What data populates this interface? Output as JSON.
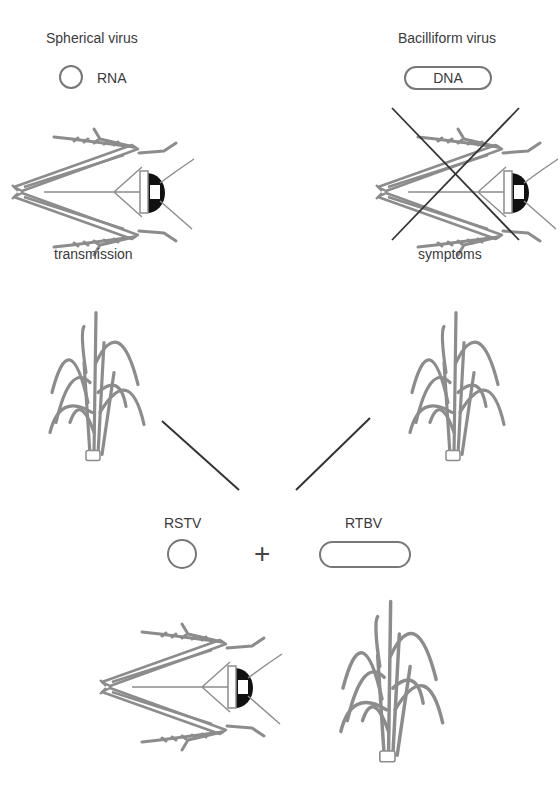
{
  "left_column": {
    "title": "Spherical virus",
    "genome_label": "RNA",
    "insect_caption": "transmission"
  },
  "right_column": {
    "title": "Bacilliform virus",
    "genome_label": "DNA",
    "insect_caption": "symptoms",
    "insect_crossed_out": true
  },
  "combination": {
    "virus_1": "RSTV",
    "operator": "+",
    "virus_2": "RTBV"
  },
  "colors": {
    "illustration_gray": "#8c8c8c",
    "line_dark": "#333333",
    "text": "#3a3a3a"
  }
}
